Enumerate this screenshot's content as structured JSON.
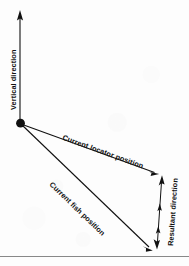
{
  "figure": {
    "background_color": "#fdfdfd",
    "ink_color": "#111111",
    "rule_color": "#888888",
    "width": 189,
    "height": 266
  },
  "labels": {
    "vertical_direction": "Vertical direction",
    "current_locator_position": "Current locator position",
    "current_fish_position": "Current fish position",
    "resultant_direction": "Resultant direction"
  },
  "geometry": {
    "origin": {
      "x": 20,
      "y": 123
    },
    "origin_dot_radius": 4.2,
    "vertical_arrow": {
      "x1": 20,
      "y1": 123,
      "x2": 20,
      "y2": 11
    },
    "locator_arrow": {
      "x1": 20,
      "y1": 123,
      "x2": 158,
      "y2": 173
    },
    "fish_arrow": {
      "x1": 20,
      "y1": 123,
      "x2": 152,
      "y2": 250
    },
    "resultant_arrow": {
      "x1": 162,
      "y1": 177,
      "x2": 157,
      "y2": 248
    }
  },
  "label_placement": {
    "vertical_direction": {
      "x": 16,
      "y": 110,
      "rotation": -90
    },
    "current_locator_position": {
      "x": 62,
      "y": 138,
      "rotation": 19.9
    },
    "current_fish_position": {
      "x": 49,
      "y": 184,
      "rotation": 43.9
    },
    "resultant_direction": {
      "x": 172,
      "y": 243,
      "rotation": -86
    }
  },
  "footer_rule": {
    "y": 256,
    "x1": 0,
    "x2": 189
  }
}
